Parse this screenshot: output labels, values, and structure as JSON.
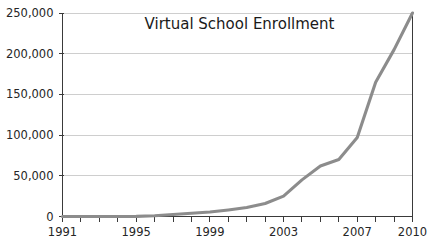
{
  "chart_data": {
    "type": "line",
    "title": "Virtual School Enrollment",
    "xlabel": "",
    "ylabel": "",
    "x": [
      1991,
      1992,
      1993,
      1994,
      1995,
      1996,
      1997,
      1998,
      1999,
      2000,
      2001,
      2002,
      2003,
      2004,
      2005,
      2006,
      2007,
      2008,
      2009,
      2010
    ],
    "values": [
      0,
      0,
      0,
      0,
      200,
      1000,
      2500,
      4000,
      5500,
      8000,
      11000,
      16000,
      25000,
      45000,
      62000,
      70000,
      97000,
      165000,
      205000,
      250000
    ],
    "series": [
      {
        "name": "Virtual School Enrollment",
        "values": [
          0,
          0,
          0,
          0,
          200,
          1000,
          2500,
          4000,
          5500,
          8000,
          11000,
          16000,
          25000,
          45000,
          62000,
          70000,
          97000,
          165000,
          205000,
          250000
        ],
        "color": "#8c8c8c"
      }
    ],
    "xlim": [
      1991,
      2010
    ],
    "ylim": [
      0,
      250000
    ],
    "ytick_values": [
      0,
      50000,
      100000,
      150000,
      200000,
      250000
    ],
    "ytick_labels": [
      "0",
      "50,000",
      "100,000",
      "150,000",
      "200,000",
      "250,000"
    ],
    "xtick_values": [
      1991,
      1992,
      1993,
      1994,
      1995,
      1996,
      1997,
      1998,
      1999,
      2000,
      2001,
      2002,
      2003,
      2004,
      2005,
      2006,
      2007,
      2008,
      2009,
      2010
    ],
    "xtick_labels_shown": [
      "1991",
      "1995",
      "1999",
      "2003",
      "2007",
      "2010"
    ],
    "xtick_labeled_values": [
      1991,
      1995,
      1999,
      2003,
      2007,
      2010
    ],
    "grid": "horizontal",
    "legend": "none",
    "colors": {
      "line": "#8c8c8c",
      "grid": "#b9b9b9",
      "axis": "#3a3a3a",
      "text": "#262626",
      "background": "#ffffff"
    }
  }
}
